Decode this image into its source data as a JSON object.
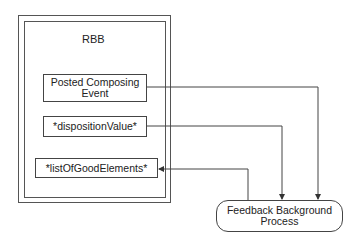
{
  "diagram": {
    "container": {
      "title": "RBB"
    },
    "nodes": [
      {
        "id": "posted",
        "label": "Posted Composing Event"
      },
      {
        "id": "disposition",
        "label": "*dispositionValue*"
      },
      {
        "id": "goodlist",
        "label": "*listOfGoodElements*"
      },
      {
        "id": "feedback",
        "label": "Feedback Background Process"
      }
    ],
    "edges": [
      {
        "from": "posted",
        "to": "feedback"
      },
      {
        "from": "disposition",
        "to": "feedback"
      },
      {
        "from": "feedback",
        "to": "goodlist"
      }
    ],
    "colors": {
      "line": "#444444",
      "frame": "#555555",
      "background": "#ffffff"
    }
  }
}
